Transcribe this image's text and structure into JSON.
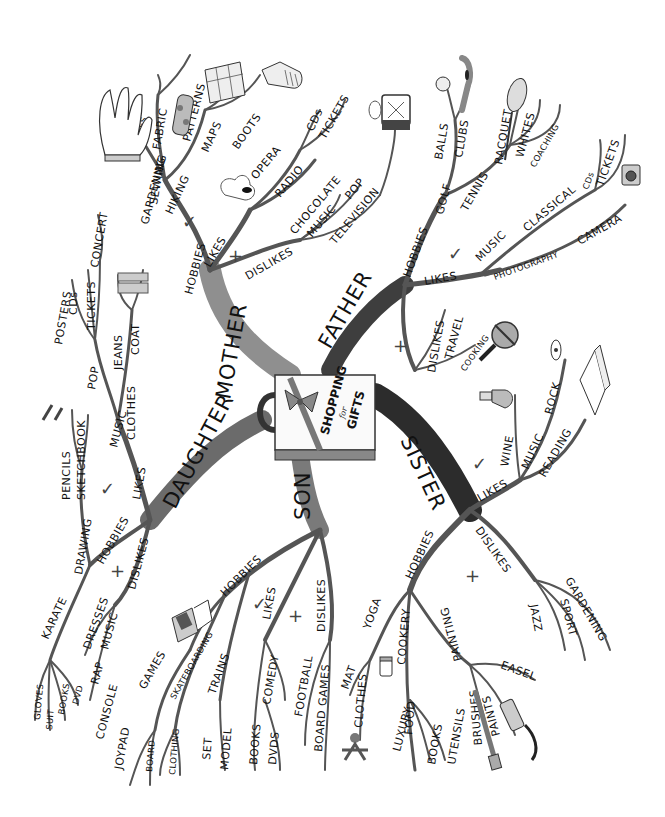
{
  "center": {
    "title_line1": "SHOPPING",
    "title_connector": "for",
    "title_line2": "GIFTS",
    "icon": "gift-bag-icon"
  },
  "colors": {
    "ink": "#111111",
    "branch_gray": "#555555",
    "mother_branch": "#8f8f8f",
    "daughter_branch": "#6b6b6b",
    "father_branch": "#3e3e3e",
    "sister_branch": "#2c2c2c",
    "son_branch": "#7a7a7a",
    "paper": "#ffffff"
  },
  "marks": {
    "like": "✓",
    "dislike": "+"
  },
  "branches": {
    "mother": {
      "label": "MOTHER",
      "hobbies": {
        "label": "HOBBIES",
        "gardening": {
          "label": "GARDENING",
          "items": [
            "PLANTS",
            "BOOKS",
            "TOOLS",
            "GLOVES"
          ]
        },
        "sewing": {
          "label": "SEWING",
          "items": [
            "FABRIC",
            "PATTERNS"
          ]
        },
        "hiking": {
          "label": "HIKING",
          "items": [
            "MAPS",
            "BOOTS"
          ]
        }
      },
      "likes": {
        "label": "LIKES",
        "opera": {
          "label": "OPERA",
          "items": [
            "CDs",
            "TICKETS"
          ]
        },
        "radio": "RADIO"
      },
      "dislikes": {
        "label": "DISLIKES",
        "items": [
          "CHOCOLATE",
          "MUSIC",
          "POP",
          "TELEVISION"
        ]
      }
    },
    "father": {
      "label": "FATHER",
      "hobbies": {
        "label": "HOBBIES",
        "golf": {
          "label": "GOLF",
          "items": [
            "BALLS",
            "CLUBS"
          ]
        },
        "tennis": {
          "label": "TENNIS",
          "items": [
            "RACQUET",
            "WHITES",
            "COACHING"
          ]
        }
      },
      "likes": {
        "label": "LIKES",
        "music": {
          "label": "MUSIC",
          "sub": "CLASSICAL",
          "items": [
            "CDs",
            "TICKETS"
          ]
        },
        "photography": {
          "label": "PHOTOGRAPHY",
          "items": [
            "CAMERA"
          ]
        }
      },
      "dislikes": {
        "label": "DISLIKES",
        "items": [
          "TRAVEL",
          "COOKING"
        ]
      }
    },
    "sister": {
      "label": "SISTER",
      "likes": {
        "label": "LIKES",
        "wine": "WINE",
        "music": {
          "label": "MUSIC",
          "items": [
            "ROCK"
          ]
        },
        "reading": "READING"
      },
      "hobbies": {
        "label": "HOBBIES",
        "yoga": {
          "label": "YOGA",
          "items": [
            "MAT",
            "CLOTHES"
          ]
        },
        "cookery": {
          "label": "COOKERY",
          "items": [
            "LUXURY",
            "FOOD",
            "BOOKS",
            "UTENSILS"
          ]
        },
        "painting": {
          "label": "PAINTING",
          "items": [
            "BRUSHES",
            "PAINTS",
            "EASEL"
          ]
        }
      },
      "dislikes": {
        "label": "DISLIKES",
        "items": [
          "JAZZ",
          "SPORT",
          "GARDENING"
        ]
      }
    },
    "son": {
      "label": "SON",
      "hobbies": {
        "label": "HOBBIES",
        "games": {
          "label": "GAMES",
          "items": [
            "CONSOLE",
            "JOYPAD"
          ]
        },
        "skateboarding": {
          "label": "SKATEBOARDING",
          "items": [
            "BOARD",
            "CLOTHING"
          ]
        },
        "trains": {
          "label": "TRAINS",
          "items": [
            "SET",
            "MODEL"
          ]
        }
      },
      "likes": {
        "label": "LIKES",
        "comedy": {
          "label": "COMEDY",
          "items": [
            "BOOKS",
            "DVDS"
          ]
        }
      },
      "dislikes": {
        "label": "DISLIKES",
        "items": [
          "FOOTBALL",
          "BOARD GAMES"
        ]
      }
    },
    "daughter": {
      "label": "DAUGHTER",
      "likes": {
        "label": "LIKES",
        "music": {
          "label": "MUSIC",
          "pop": "POP",
          "items": [
            "POSTERS",
            "CDs",
            "TICKETS",
            "CONCERT"
          ]
        },
        "clothes": {
          "label": "CLOTHES",
          "items": [
            "JEANS",
            "COAT"
          ]
        }
      },
      "hobbies": {
        "label": "HOBBIES",
        "drawing": {
          "label": "DRAWING",
          "items": [
            "PENCILS",
            "SKETCHBOOK"
          ]
        },
        "karate": {
          "label": "KARATE",
          "items": [
            "GLOVES",
            "SUIT",
            "BOOKS",
            "DVD"
          ]
        }
      },
      "dislikes": {
        "label": "DISLIKES",
        "items": [
          "DRESSES",
          "MUSIC",
          "RAP"
        ]
      }
    }
  }
}
